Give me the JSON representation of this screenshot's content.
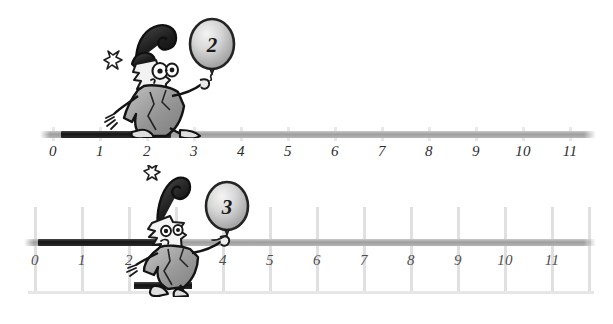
{
  "page": {
    "background_color": "#ffffff",
    "width": 613,
    "height": 324
  },
  "colors": {
    "axis_grey": "#9e9e9e",
    "axis_dark": "#141414",
    "tick_grey": "#e3e3e3",
    "label_dark": "#2b2b2b",
    "label_grey": "#4d4d4d",
    "balloon_fill": "#d8d8d8",
    "balloon_outline": "#2b2b2b",
    "character_dark": "#1f1f1f",
    "character_grey": "#9a9a9a"
  },
  "number_lines": [
    {
      "id": "number-line-top",
      "tick_labels": [
        "0",
        "1",
        "2",
        "3",
        "4",
        "5",
        "6",
        "7",
        "8",
        "9",
        "10",
        "11"
      ],
      "highlight_start": 0,
      "highlight_end": 2.4,
      "grid": false,
      "balloon_label": "2",
      "character_position": 2.4
    },
    {
      "id": "number-line-bottom",
      "tick_labels": [
        "0",
        "1",
        "2",
        "3",
        "4",
        "5",
        "6",
        "7",
        "8",
        "9",
        "10",
        "11"
      ],
      "highlight_start": 0,
      "highlight_end": 2.4,
      "grid": true,
      "balloon_label": "3",
      "character_position": 2.6,
      "jump_bar_start": 2,
      "jump_bar_end": 3
    }
  ]
}
